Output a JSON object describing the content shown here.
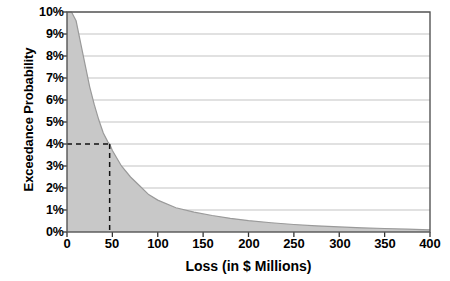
{
  "chart_data": {
    "type": "area",
    "title": "",
    "subtitle": "",
    "xlabel": "Loss (in $ Millions)",
    "ylabel": "Exceedance Probability",
    "xlim": [
      0,
      400
    ],
    "ylim": [
      0,
      10
    ],
    "xticks": [
      "0",
      "50",
      "100",
      "150",
      "200",
      "250",
      "300",
      "350",
      "400"
    ],
    "xtick_values": [
      0,
      50,
      100,
      150,
      200,
      250,
      300,
      350,
      400
    ],
    "yticks": [
      "0%",
      "1%",
      "2%",
      "3%",
      "4%",
      "5%",
      "6%",
      "7%",
      "8%",
      "9%",
      "10%"
    ],
    "ytick_values": [
      0,
      1,
      2,
      3,
      4,
      5,
      6,
      7,
      8,
      9,
      10
    ],
    "grid": "horizontal",
    "legend": "none",
    "fill_color": "#c8c8c8",
    "line_color": "#9a9a9a",
    "axis_color": "#444444",
    "grid_color": "#b4b4b4",
    "series": [
      {
        "name": "Exceedance Probability",
        "x": [
          0,
          5,
          10,
          15,
          20,
          25,
          30,
          35,
          40,
          45,
          47,
          50,
          60,
          70,
          80,
          90,
          100,
          120,
          140,
          160,
          180,
          200,
          225,
          250,
          275,
          300,
          325,
          350,
          375,
          400
        ],
        "values": [
          10.0,
          10.0,
          9.6,
          8.6,
          7.6,
          6.6,
          5.8,
          5.1,
          4.5,
          4.1,
          4.0,
          3.7,
          3.0,
          2.5,
          2.1,
          1.7,
          1.45,
          1.1,
          0.9,
          0.75,
          0.62,
          0.52,
          0.42,
          0.34,
          0.28,
          0.23,
          0.19,
          0.16,
          0.13,
          0.1
        ]
      }
    ],
    "annotations": [
      {
        "name": "exceedance-marker",
        "type": "dashed-crosshair",
        "x": 47,
        "y": 4,
        "label_x": "",
        "label_y": "4%",
        "style": "dashed",
        "color": "#111111"
      }
    ]
  }
}
